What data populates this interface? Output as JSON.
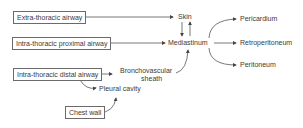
{
  "diagram": {
    "sources": [
      {
        "id": "extra",
        "label": "Extra-thoracic airway"
      },
      {
        "id": "proximal",
        "label": "Intra-thoracic proximal airway"
      },
      {
        "id": "distal",
        "label": "Intra-thoracic distal airway"
      },
      {
        "id": "chest",
        "label": "Chest wall"
      }
    ],
    "nodes": [
      {
        "id": "skin",
        "label": "Skin"
      },
      {
        "id": "mediastinum",
        "label": "Mediastinum"
      },
      {
        "id": "bronchovascular",
        "label_line1": "Bronchovascular",
        "label_line2": "sheath"
      },
      {
        "id": "pleural",
        "label": "Pleural cavity"
      },
      {
        "id": "pericardium",
        "label": "Pericardium"
      },
      {
        "id": "retroperitoneum",
        "label": "Retroperitoneum"
      },
      {
        "id": "peritoneum",
        "label": "Peritoneum"
      }
    ],
    "edges": [
      [
        "Extra-thoracic airway",
        "Skin"
      ],
      [
        "Skin",
        "Mediastinum"
      ],
      [
        "Mediastinum",
        "Skin"
      ],
      [
        "Intra-thoracic proximal airway",
        "Mediastinum"
      ],
      [
        "Intra-thoracic distal airway",
        "Bronchovascular sheath"
      ],
      [
        "Bronchovascular sheath",
        "Mediastinum"
      ],
      [
        "Intra-thoracic distal airway",
        "Pleural cavity"
      ],
      [
        "Chest wall",
        "Pleural cavity"
      ],
      [
        "Mediastinum",
        "Pericardium"
      ],
      [
        "Mediastinum",
        "Retroperitoneum"
      ],
      [
        "Mediastinum",
        "Peritoneum"
      ]
    ]
  }
}
